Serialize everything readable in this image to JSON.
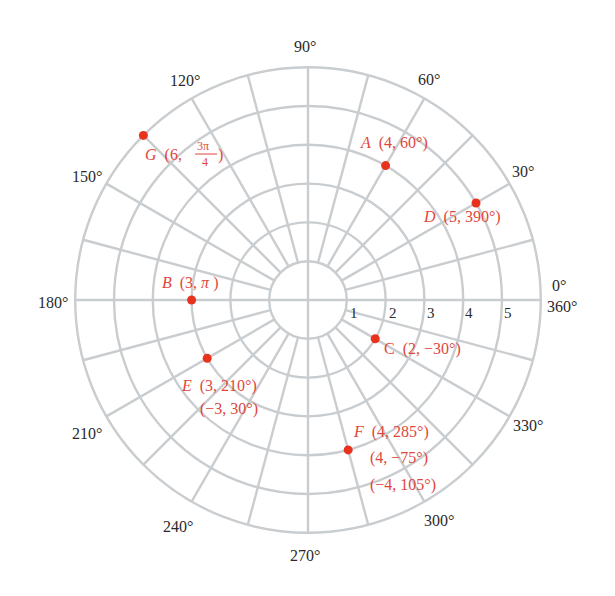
{
  "chart_data": {
    "type": "polar-grid",
    "title": "",
    "center_px": [
      308,
      300
    ],
    "unit_px": 38.8,
    "radial_rings": [
      1,
      2,
      3,
      4,
      5,
      6
    ],
    "radial_tick_labels": [
      "1",
      "2",
      "3",
      "4",
      "5"
    ],
    "spoke_step_deg": 15,
    "spoke_start_ring": 1,
    "angle_labels": [
      {
        "deg": 0,
        "text": "0°"
      },
      {
        "deg": 0,
        "text": "360°",
        "secondary": true
      },
      {
        "deg": 30,
        "text": "30°"
      },
      {
        "deg": 60,
        "text": "60°"
      },
      {
        "deg": 90,
        "text": "90°"
      },
      {
        "deg": 120,
        "text": "120°"
      },
      {
        "deg": 150,
        "text": "150°"
      },
      {
        "deg": 180,
        "text": "180°"
      },
      {
        "deg": 210,
        "text": "210°"
      },
      {
        "deg": 240,
        "text": "240°"
      },
      {
        "deg": 270,
        "text": "270°"
      },
      {
        "deg": 300,
        "text": "300°"
      },
      {
        "deg": 330,
        "text": "330°"
      }
    ],
    "points": [
      {
        "name": "A",
        "r": 4,
        "theta_deg": 60,
        "label_lines": [
          "(4, 60°)"
        ]
      },
      {
        "name": "B",
        "r": 3,
        "theta_deg": 180,
        "label_lines": [
          "(3, π)"
        ]
      },
      {
        "name": "C",
        "r": 2,
        "theta_deg": -30,
        "label_lines": [
          "(2, −30°)"
        ]
      },
      {
        "name": "D",
        "r": 5,
        "theta_deg": 390,
        "label_lines": [
          "(5, 390°)"
        ]
      },
      {
        "name": "E",
        "r": 3,
        "theta_deg": 210,
        "label_lines": [
          "(3, 210°)",
          "(−3, 30°)"
        ]
      },
      {
        "name": "F",
        "r": 4,
        "theta_deg": 285,
        "label_lines": [
          "(4, 285°)",
          "(4, −75°)",
          "(−4, 105°)"
        ]
      },
      {
        "name": "G",
        "r": 6,
        "theta_deg": 135,
        "label_lines": [
          "(6, 3π/4)"
        ]
      }
    ],
    "colors": {
      "grid": "#c9cdd0",
      "point": "#e8321e",
      "point_label": "#e0473a",
      "axis_label": "#2a2a2a"
    }
  },
  "labels": {
    "angles": {
      "a0": "0°",
      "a360": "360°",
      "a30": "30°",
      "a60": "60°",
      "a90": "90°",
      "a120": "120°",
      "a150": "150°",
      "a180": "180°",
      "a210": "210°",
      "a240": "240°",
      "a270": "270°",
      "a300": "300°",
      "a330": "330°"
    },
    "radii": {
      "r1": "1",
      "r2": "2",
      "r3": "3",
      "r4": "4",
      "r5": "5"
    },
    "points": {
      "A": {
        "name": "A",
        "line1": "(4, 60°)"
      },
      "B": {
        "name": "B",
        "line1": "(3, ",
        "pi": "π",
        "close": ")"
      },
      "C": {
        "name": "C",
        "line1": "(2, −30°)"
      },
      "D": {
        "name": "D",
        "line1": "(5, 390°)"
      },
      "E": {
        "name": "E",
        "line1": "(3, 210°)",
        "line2": "(−3, 30°)"
      },
      "F": {
        "name": "F",
        "line1": "(4, 285°)",
        "line2": "(4, −75°)",
        "line3": "(−4, 105°)"
      },
      "G": {
        "name": "G",
        "open": "(6, ",
        "num": "3π",
        "den": "4",
        "close": ")"
      }
    }
  }
}
